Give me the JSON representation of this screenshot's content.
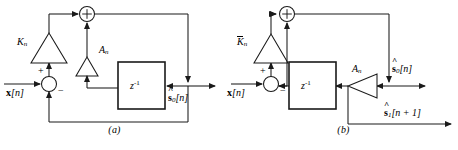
{
  "figure": {
    "kind": "block-diagram-pair"
  },
  "panel_a": {
    "caption": "(a)",
    "input_label_base": "x",
    "input_label_index": "[n]",
    "gain_top": {
      "symbol": "K",
      "overbar": false,
      "subscript": "n"
    },
    "gain_mid": {
      "symbol": "A",
      "overbar": false,
      "subscript": "n"
    },
    "delay_block": {
      "base": "z",
      "exponent": "-1"
    },
    "adder_top_sign": "+",
    "sum_node_plus": "+",
    "sum_node_minus": "−",
    "output_0": {
      "base": "s",
      "subscript": "0",
      "index": "[n]",
      "hat": true
    }
  },
  "panel_b": {
    "caption": "(b)",
    "input_label_base": "x",
    "input_label_index": "[n]",
    "gain_top": {
      "symbol": "K",
      "overbar": true,
      "subscript": "n"
    },
    "gain_mid": {
      "symbol": "A",
      "overbar": false,
      "subscript": "n"
    },
    "delay_block": {
      "base": "z",
      "exponent": "-1"
    },
    "adder_top_sign": "+",
    "sum_node_plus": "+",
    "sum_node_minus": "−",
    "output_0": {
      "base": "s",
      "subscript": "0",
      "index": "[n]",
      "hat": true
    },
    "output_1": {
      "base": "s",
      "subscript": "1",
      "index": "[n + 1]",
      "hat": true
    }
  },
  "colors": {
    "stroke": "#1a1a1a",
    "background": "#ffffff"
  }
}
